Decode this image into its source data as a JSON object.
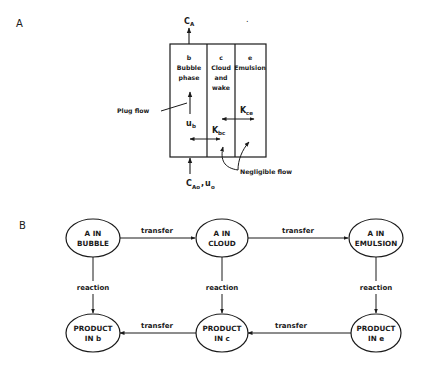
{
  "panel_a": {
    "label": "A",
    "outlet_label": "C",
    "outlet_sub": "A",
    "inlet_label": "C",
    "inlet_sub": "Ao",
    "inlet_sep": ",",
    "inlet_u": "u",
    "inlet_u_sub": "o",
    "phases": [
      {
        "letter": "b",
        "line1": "Bubble",
        "line2": "phase",
        "line3": ""
      },
      {
        "letter": "c",
        "line1": "Cloud",
        "line2": "and",
        "line3": "wake"
      },
      {
        "letter": "e",
        "line1": "Emulsion",
        "line2": "",
        "line3": ""
      }
    ],
    "plug_flow_label": "Plug flow",
    "ub_label": "u",
    "ub_sub": "b",
    "kbc_label": "K",
    "kbc_sub": "bc",
    "kce_label": "K",
    "kce_sub": "ce",
    "negligible_flow_label": "Negligible flow"
  },
  "panel_b": {
    "label": "B",
    "nodes": {
      "a_bubble": [
        "A  IN",
        "BUBBLE"
      ],
      "a_cloud": [
        "A  IN",
        "CLOUD"
      ],
      "a_emulsion": [
        "A  IN",
        "EMULSION"
      ],
      "p_b": [
        "PRODUCT",
        "IN  b"
      ],
      "p_c": [
        "PRODUCT",
        "IN  c"
      ],
      "p_e": [
        "PRODUCT",
        "IN e"
      ]
    },
    "edges": {
      "top_transfer_1": "transfer",
      "top_transfer_2": "transfer",
      "bottom_transfer_1": "transfer",
      "bottom_transfer_2": "transfer",
      "reaction_1": "reaction",
      "reaction_2": "reaction",
      "reaction_3": "reaction"
    }
  },
  "dot": "."
}
